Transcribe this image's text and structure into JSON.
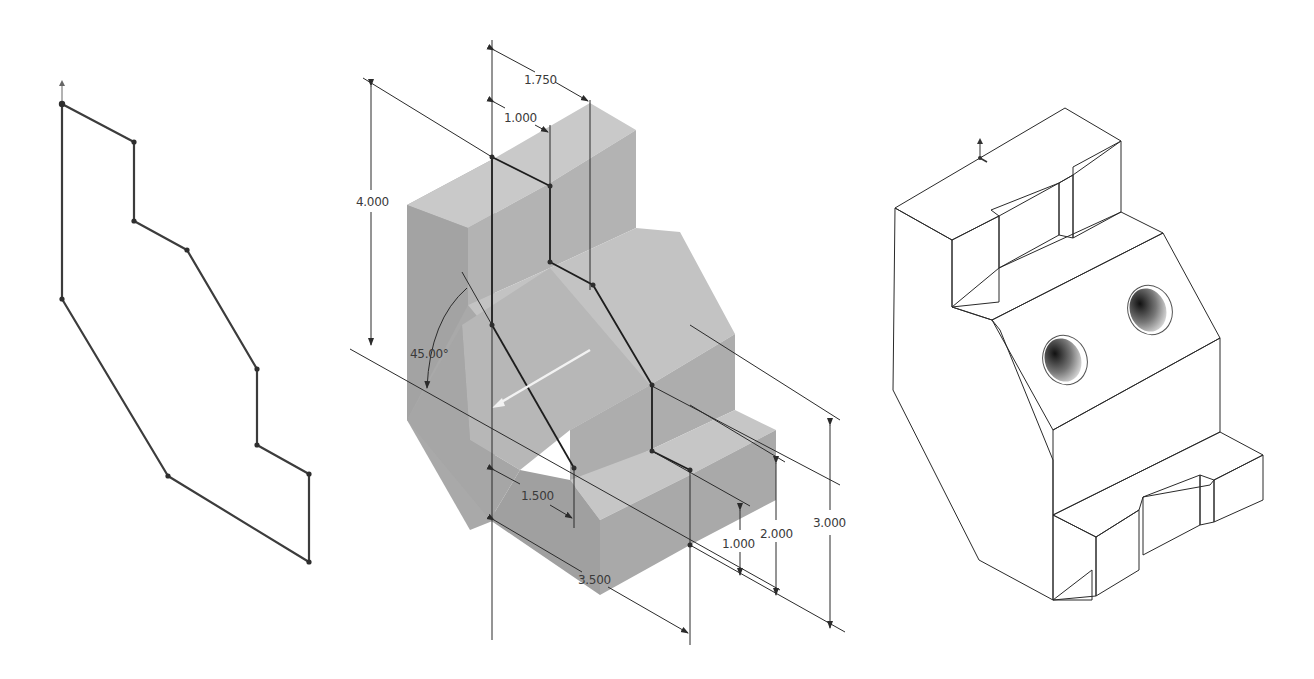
{
  "figure": {
    "panels": [
      {
        "id": "sketch",
        "label": "2D sketch profile"
      },
      {
        "id": "extrude-preview",
        "label": "Extrude preview with dimensions"
      },
      {
        "id": "finished-part",
        "label": "Finished isometric part with slots and holes"
      }
    ]
  },
  "dimensions": {
    "width_top": "1.750",
    "step_top": "1.000",
    "height_left": "4.000",
    "angle": "45.00°",
    "step_bottom": "1.500",
    "width_bottom": "3.500",
    "height_step1": "1.000",
    "height_step2": "2.000",
    "height_right": "3.000"
  },
  "colors": {
    "background": "#ffffff",
    "sketch_line": "#3c3c3c",
    "preview_face_light": "#c4c4c4",
    "preview_face_mid": "#b0b0b0",
    "preview_face_dark": "#a2a2a2",
    "part_top": "#ffffff",
    "part_side": "#8e8e8e",
    "part_side_dark": "#7b7b7b"
  }
}
